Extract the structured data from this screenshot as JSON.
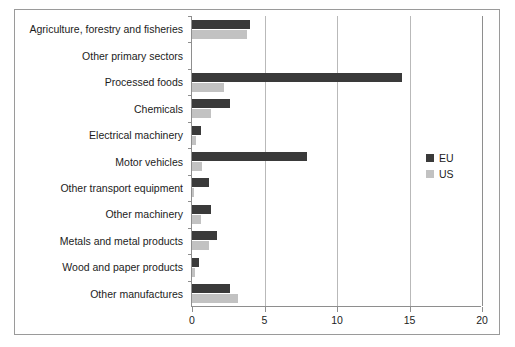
{
  "chart_data": {
    "type": "bar",
    "orientation": "horizontal",
    "title": "",
    "xlabel": "",
    "ylabel": "",
    "xlim": [
      0,
      20
    ],
    "xticks": [
      0,
      5,
      10,
      15,
      20
    ],
    "xticklabels": [
      "0",
      "5",
      "10",
      "15",
      "20"
    ],
    "grid": "vertical",
    "legend_position": "right",
    "categories": [
      "Agriculture, forestry and fisheries",
      "Other primary sectors",
      "Processed foods",
      "Chemicals",
      "Electrical machinery",
      "Motor vehicles",
      "Other transport equipment",
      "Other machinery",
      "Metals and metal products",
      "Wood and paper products",
      "Other manufactures"
    ],
    "series": [
      {
        "name": "EU",
        "color": "#3a3a3a",
        "values": [
          4.0,
          0.0,
          14.5,
          2.6,
          0.6,
          7.9,
          1.2,
          1.3,
          1.7,
          0.5,
          2.6
        ]
      },
      {
        "name": "US",
        "color": "#c2c2c2",
        "values": [
          3.8,
          0.0,
          2.2,
          1.3,
          0.25,
          0.7,
          0.15,
          0.6,
          1.2,
          0.2,
          3.2
        ]
      }
    ]
  },
  "legend": {
    "items": [
      {
        "label": "EU",
        "color": "#3a3a3a"
      },
      {
        "label": "US",
        "color": "#c2c2c2"
      }
    ]
  },
  "colors": {
    "eu": "#3a3a3a",
    "us": "#c2c2c2",
    "gridline": "#b9b9b9",
    "axis": "#8e8e8e",
    "frame": "#9a9a9a",
    "text": "#1c1c1c",
    "background": "#ffffff"
  }
}
